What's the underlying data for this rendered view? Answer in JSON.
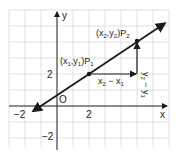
{
  "diagram": {
    "type": "coordinate-plane-slope",
    "axes": {
      "x_label": "x",
      "y_label": "y",
      "origin_label": "O",
      "x_ticks": [
        {
          "value": -2,
          "label": "−2"
        },
        {
          "value": 2,
          "label": "2"
        }
      ],
      "y_ticks": [
        {
          "value": 2,
          "label": "2"
        },
        {
          "value": -2,
          "label": "−2"
        }
      ]
    },
    "line": {
      "through": [
        [
          2,
          2
        ],
        [
          5,
          4
        ]
      ],
      "slope": "2/3"
    },
    "points": [
      {
        "name": "P1",
        "coords": [
          2,
          2
        ],
        "label_main": "(x",
        "label_sub1": "1",
        "label_mid": ",y",
        "label_sub2": "1",
        "label_end": ")P",
        "label_sub3": "1"
      },
      {
        "name": "P2",
        "coords": [
          5,
          4
        ],
        "label_main": "(x",
        "label_sub1": "2",
        "label_mid": ",y",
        "label_sub2": "2",
        "label_end": ")P",
        "label_sub3": "2"
      }
    ],
    "run_label": {
      "a": "x",
      "a_sub": "2",
      "op": " − x",
      "b_sub": "1"
    },
    "rise_label": {
      "a": "y",
      "a_sub": "2",
      "op": " − y",
      "b_sub": "1"
    },
    "colors": {
      "grid": "#d9d9d9",
      "ink": "#1a1a1a",
      "background": "#ffffff"
    }
  }
}
